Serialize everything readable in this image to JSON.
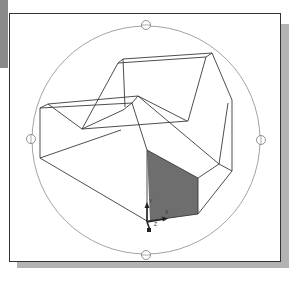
{
  "viewport": {
    "title": "3D Orbit Viewport",
    "shaded_face_color": "#6e6e6e",
    "line_color": "#3a3a3a",
    "arcball_color": "#888888"
  },
  "ucs_icon": {
    "axes": [
      "Y",
      "X",
      "Z"
    ]
  }
}
